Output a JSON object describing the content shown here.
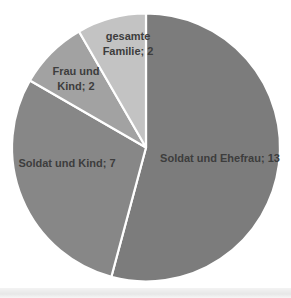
{
  "chart_data": {
    "type": "pie",
    "title": "",
    "categories": [
      "Soldat und Ehefrau",
      "Soldat und Kind",
      "Frau und Kind",
      "gesamte Familie"
    ],
    "values": [
      13,
      7,
      2,
      2
    ],
    "total": 24,
    "slices": [
      {
        "label": "Soldat und Ehefrau",
        "value": 13,
        "display": "Soldat und Ehefrau; 13",
        "color": "#7c7c7c"
      },
      {
        "label": "Soldat und Kind",
        "value": 7,
        "display": "Soldat und Kind; 7",
        "color": "#878787"
      },
      {
        "label": "Frau und Kind",
        "value": 2,
        "display": "Frau und\nKind; 2",
        "color": "#a2a2a2"
      },
      {
        "label": "gesamte Familie",
        "value": 2,
        "display": "gesamte\nFamilie; 2",
        "color": "#c3c3c3"
      }
    ],
    "start_angle_deg": 0,
    "direction": "clockwise",
    "legend": "none",
    "separator_color": "#ffffff",
    "label_color": "#3d3d3d"
  }
}
